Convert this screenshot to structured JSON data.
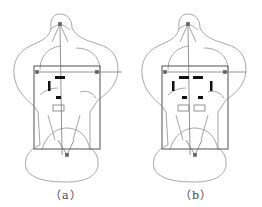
{
  "figure": {
    "panels": [
      {
        "id": "a",
        "caption": "（a）",
        "electrodes": {
          "horizontal_bars": 1,
          "vertical_bars": 1,
          "small_filled": 1,
          "outlined": 1
        }
      },
      {
        "id": "b",
        "caption": "（b）",
        "electrodes": {
          "horizontal_bars": 2,
          "vertical_bars": 2,
          "small_filled": 2,
          "outlined": 2
        }
      }
    ],
    "colors": {
      "outline": "#8a8a8a",
      "frame": "#707070",
      "electrode": "#111111",
      "marker": "#555555"
    }
  }
}
